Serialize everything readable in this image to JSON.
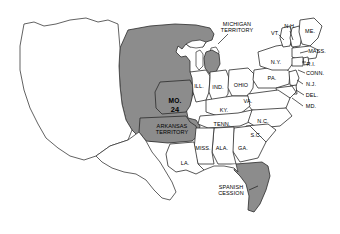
{
  "map": {
    "title": "United States 1821 — Missouri Compromise",
    "background_color": "#ffffff",
    "shaded_fill": "#8c8c8c",
    "outline_color": "#2b2b2b",
    "text_color": "#000000",
    "legend_note": "Shaded areas denote territories and states of the Missouri Compromise era"
  },
  "labels": [
    {
      "id": "michigan-territory",
      "text": "MICHIGAN\nTERRITORY",
      "x": 237,
      "y": 27,
      "style": "tiny",
      "shaded": true
    },
    {
      "id": "vermont",
      "text": "VT.",
      "x": 275,
      "y": 33,
      "style": "tiny",
      "shaded": false
    },
    {
      "id": "new-hampshire",
      "text": "N.H.",
      "x": 290,
      "y": 26,
      "style": "tiny",
      "shaded": false
    },
    {
      "id": "maine",
      "text": "ME.",
      "x": 310,
      "y": 31,
      "style": "tiny",
      "shaded": false
    },
    {
      "id": "massachusetts",
      "text": "MASS.",
      "x": 317,
      "y": 51,
      "style": "tiny",
      "shaded": false
    },
    {
      "id": "new-york",
      "text": "N.Y.",
      "x": 276,
      "y": 62,
      "style": "tiny",
      "shaded": false
    },
    {
      "id": "rhode-island",
      "text": "R.I.",
      "x": 311,
      "y": 64,
      "style": "tiny",
      "shaded": false
    },
    {
      "id": "connecticut",
      "text": "CONN.",
      "x": 315,
      "y": 73,
      "style": "tiny",
      "shaded": false
    },
    {
      "id": "new-jersey",
      "text": "N.J.",
      "x": 311,
      "y": 84,
      "style": "tiny",
      "shaded": false
    },
    {
      "id": "delaware",
      "text": "DEL.",
      "x": 312,
      "y": 95,
      "style": "tiny",
      "shaded": false
    },
    {
      "id": "maryland",
      "text": "MD.",
      "x": 311,
      "y": 106,
      "style": "tiny",
      "shaded": false
    },
    {
      "id": "pennsylvania",
      "text": "PA.",
      "x": 272,
      "y": 78,
      "style": "tiny",
      "shaded": false
    },
    {
      "id": "ohio",
      "text": "OHIO",
      "x": 241,
      "y": 85,
      "style": "tiny",
      "shaded": false
    },
    {
      "id": "indiana",
      "text": "IND.",
      "x": 218,
      "y": 87,
      "style": "tiny",
      "shaded": false
    },
    {
      "id": "illinois",
      "text": "ILL.",
      "x": 199,
      "y": 86,
      "style": "tiny",
      "shaded": false
    },
    {
      "id": "kentucky",
      "text": "KY.",
      "x": 224,
      "y": 110,
      "style": "tiny",
      "shaded": false
    },
    {
      "id": "virginia",
      "text": "VA.",
      "x": 248,
      "y": 101,
      "style": "tiny",
      "shaded": false
    },
    {
      "id": "missouri",
      "text": "MO.",
      "x": 175,
      "y": 101,
      "style": "big",
      "shaded": true
    },
    {
      "id": "missouri-statehood-number",
      "text": "24",
      "x": 175,
      "y": 110,
      "style": "num",
      "shaded": true
    },
    {
      "id": "arkansas-territory",
      "text": "ARKANSAS\nTERRITORY",
      "x": 172,
      "y": 129,
      "style": "tiny",
      "shaded": true
    },
    {
      "id": "tennessee",
      "text": "TENN.",
      "x": 222,
      "y": 124,
      "style": "tiny",
      "shaded": false
    },
    {
      "id": "north-carolina",
      "text": "N.C.",
      "x": 263,
      "y": 121,
      "style": "tiny",
      "shaded": false
    },
    {
      "id": "south-carolina",
      "text": "S.C.",
      "x": 256,
      "y": 135,
      "style": "tiny",
      "shaded": false
    },
    {
      "id": "mississippi",
      "text": "MISS.",
      "x": 203,
      "y": 148,
      "style": "tiny",
      "shaded": false
    },
    {
      "id": "alabama",
      "text": "ALA.",
      "x": 222,
      "y": 148,
      "style": "tiny",
      "shaded": false
    },
    {
      "id": "georgia",
      "text": "GA.",
      "x": 243,
      "y": 148,
      "style": "tiny",
      "shaded": false
    },
    {
      "id": "louisiana",
      "text": "LA.",
      "x": 185,
      "y": 163,
      "style": "tiny",
      "shaded": false
    },
    {
      "id": "spanish-cession",
      "text": "SPANISH\nCESSION",
      "x": 231,
      "y": 190,
      "style": "tiny",
      "shaded": true
    }
  ],
  "regions": [
    {
      "id": "louisiana-purchase",
      "name": "Louisiana Purchase Territory",
      "shaded": true
    },
    {
      "id": "michigan-territory-region",
      "name": "Michigan Territory",
      "shaded": true
    },
    {
      "id": "missouri-region",
      "name": "Missouri",
      "shaded": true
    },
    {
      "id": "arkansas-territory-region",
      "name": "Arkansas Territory",
      "shaded": true
    },
    {
      "id": "florida-region",
      "name": "Florida (Spanish Cession)",
      "shaded": true
    }
  ]
}
